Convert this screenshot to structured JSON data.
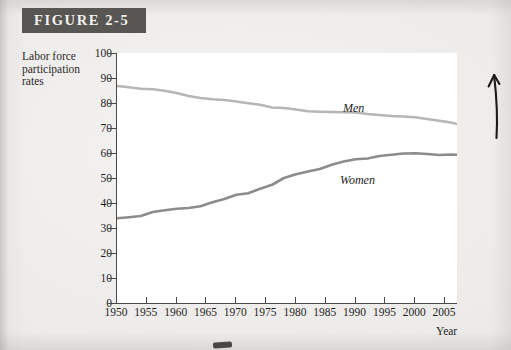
{
  "figure": {
    "banner_label": "FIGURE 2-5"
  },
  "axis": {
    "y_title": "Labor force participation rates",
    "x_title": "Year"
  },
  "annotations": {
    "arrow_up": "up-arrow-annotation"
  },
  "chart_data": {
    "type": "line",
    "title": "FIGURE 2-5",
    "xlabel": "Year",
    "ylabel": "Labor force participation rates",
    "xlim": [
      1950,
      2007
    ],
    "ylim": [
      0,
      100
    ],
    "yticks": [
      0,
      10,
      20,
      30,
      40,
      50,
      60,
      70,
      80,
      90,
      100
    ],
    "xticks": [
      1950,
      1955,
      1960,
      1965,
      1970,
      1975,
      1980,
      1985,
      1990,
      1995,
      2000,
      2005
    ],
    "grid": false,
    "legend": "inline-labels",
    "series": [
      {
        "name": "Men",
        "color": "#b8b6b4",
        "label_position": "above-line-at-1986",
        "x": [
          1950,
          1952,
          1954,
          1956,
          1958,
          1960,
          1962,
          1964,
          1966,
          1968,
          1970,
          1972,
          1974,
          1976,
          1978,
          1980,
          1982,
          1984,
          1986,
          1988,
          1990,
          1992,
          1994,
          1996,
          1998,
          2000,
          2002,
          2004,
          2006,
          2007
        ],
        "values": [
          86.8,
          86.3,
          85.7,
          85.5,
          84.9,
          84.0,
          82.8,
          82.0,
          81.5,
          81.2,
          80.6,
          79.9,
          79.3,
          78.2,
          78.0,
          77.4,
          76.7,
          76.5,
          76.4,
          76.3,
          76.2,
          75.6,
          75.2,
          74.8,
          74.6,
          74.3,
          73.6,
          72.9,
          72.2,
          71.6
        ]
      },
      {
        "name": "Women",
        "color": "#8e8c89",
        "label_position": "below-line-at-1986",
        "x": [
          1950,
          1952,
          1954,
          1956,
          1958,
          1960,
          1962,
          1964,
          1966,
          1968,
          1970,
          1972,
          1974,
          1976,
          1978,
          1980,
          1982,
          1984,
          1986,
          1988,
          1990,
          1992,
          1994,
          1996,
          1998,
          2000,
          2002,
          2004,
          2006,
          2007
        ],
        "values": [
          33.9,
          34.3,
          34.8,
          36.4,
          37.1,
          37.7,
          38.0,
          38.7,
          40.3,
          41.6,
          43.3,
          43.9,
          45.7,
          47.3,
          50.0,
          51.5,
          52.6,
          53.6,
          55.3,
          56.6,
          57.5,
          57.8,
          58.8,
          59.3,
          59.8,
          59.9,
          59.6,
          59.2,
          59.4,
          59.3
        ]
      }
    ]
  }
}
